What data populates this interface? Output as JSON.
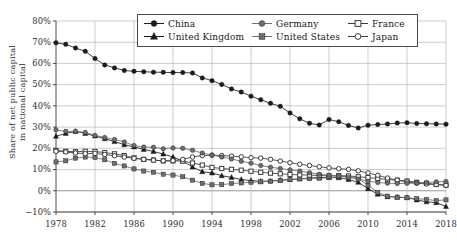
{
  "axis": {
    "ylabel_line1": "Share of net public capital",
    "ylabel_line2": "in national capital",
    "yticks": [
      "80%",
      "70%",
      "60%",
      "50%",
      "40%",
      "30%",
      "20%",
      "10%",
      "0%",
      "−10%"
    ],
    "xticks": [
      "1978",
      "1982",
      "1986",
      "1990",
      "1994",
      "1998",
      "2002",
      "2006",
      "2010",
      "2014",
      "2018"
    ]
  },
  "legend": {
    "rows": [
      [
        {
          "label": "China",
          "marker": "filled-circle",
          "color": "#1c1c1c",
          "icon": "legend-marker-icon"
        },
        {
          "label": "Germany",
          "marker": "filled-circle",
          "color": "#6e6e6e",
          "icon": "legend-marker-icon"
        },
        {
          "label": "France",
          "marker": "open-square",
          "color": "#3a3a3a",
          "icon": "legend-marker-icon"
        }
      ],
      [
        {
          "label": "United Kingdom",
          "marker": "filled-triangle",
          "color": "#1c1c1c",
          "icon": "legend-marker-icon"
        },
        {
          "label": "United States",
          "marker": "filled-square",
          "color": "#6e6e6e",
          "icon": "legend-marker-icon"
        },
        {
          "label": "Japan",
          "marker": "open-circle",
          "color": "#3a3a3a",
          "icon": "legend-marker-icon"
        }
      ]
    ]
  },
  "chart_data": {
    "type": "line",
    "title": "",
    "xlabel": "",
    "ylabel": "Share of net public capital in national capital",
    "xlim": [
      1978,
      2018
    ],
    "ylim": [
      -10,
      80
    ],
    "ytick_values": [
      80,
      70,
      60,
      50,
      40,
      30,
      20,
      10,
      0,
      -10
    ],
    "xtick_values": [
      1978,
      1982,
      1986,
      1990,
      1994,
      1998,
      2002,
      2006,
      2010,
      2014,
      2018
    ],
    "grid": "horizontal-and-vertical",
    "legend_position": "top-center",
    "x": [
      1978,
      1979,
      1980,
      1981,
      1982,
      1983,
      1984,
      1985,
      1986,
      1987,
      1988,
      1989,
      1990,
      1991,
      1992,
      1993,
      1994,
      1995,
      1996,
      1997,
      1998,
      1999,
      2000,
      2001,
      2002,
      2003,
      2004,
      2005,
      2006,
      2007,
      2008,
      2009,
      2010,
      2011,
      2012,
      2013,
      2014,
      2015,
      2016,
      2017,
      2018
    ],
    "series": [
      {
        "name": "China",
        "marker": "filled-circle",
        "color": "#1c1c1c",
        "values": [
          69.7,
          69.0,
          67.3,
          65.7,
          62.3,
          59.3,
          57.9,
          56.7,
          56.3,
          56.1,
          55.9,
          55.8,
          55.7,
          55.7,
          55.5,
          53.2,
          51.9,
          50.1,
          48.0,
          46.5,
          44.6,
          42.9,
          41.2,
          39.8,
          36.7,
          33.9,
          31.8,
          31.0,
          33.6,
          32.5,
          30.8,
          29.6,
          30.9,
          31.2,
          31.5,
          31.9,
          32.1,
          31.7,
          31.6,
          31.5,
          31.4
        ]
      },
      {
        "name": "Germany",
        "marker": "filled-circle",
        "color": "#6e6e6e",
        "values": [
          28.7,
          28.0,
          28.0,
          27.5,
          26.1,
          25.1,
          24.2,
          23.0,
          21.3,
          20.6,
          20.5,
          19.8,
          20.2,
          20.0,
          19.1,
          17.8,
          16.8,
          15.9,
          15.0,
          13.9,
          13.0,
          11.9,
          11.1,
          10.5,
          9.9,
          9.3,
          8.5,
          7.8,
          7.3,
          6.9,
          6.3,
          5.5,
          4.5,
          3.9,
          3.6,
          3.4,
          3.5,
          3.6,
          3.9,
          4.2,
          4.4
        ]
      },
      {
        "name": "France",
        "marker": "open-square",
        "color": "#3a3a3a",
        "values": [
          19.0,
          18.6,
          18.4,
          18.6,
          18.5,
          18.0,
          17.4,
          16.6,
          15.5,
          14.8,
          14.5,
          14.1,
          14.1,
          14.0,
          13.1,
          12.1,
          11.0,
          10.5,
          10.1,
          9.7,
          9.2,
          8.7,
          8.3,
          8.0,
          7.7,
          7.5,
          7.4,
          7.2,
          7.0,
          7.1,
          7.0,
          6.6,
          6.2,
          5.8,
          5.3,
          5.0,
          4.6,
          4.0,
          3.5,
          3.0,
          2.7
        ]
      },
      {
        "name": "United Kingdom",
        "marker": "filled-triangle",
        "color": "#1c1c1c",
        "values": [
          25.7,
          27.0,
          28.0,
          27.0,
          25.8,
          24.5,
          23.2,
          21.7,
          20.7,
          19.5,
          18.5,
          17.3,
          15.9,
          14.0,
          11.2,
          9.0,
          8.4,
          7.1,
          6.3,
          5.3,
          4.8,
          4.5,
          4.6,
          5.0,
          5.3,
          5.6,
          6.0,
          6.2,
          6.3,
          6.1,
          5.3,
          4.0,
          1.0,
          -1.6,
          -2.8,
          -3.0,
          -3.2,
          -4.3,
          -5.2,
          -5.6,
          -7.4
        ]
      },
      {
        "name": "United States",
        "marker": "filled-square",
        "color": "#6e6e6e",
        "values": [
          13.6,
          14.1,
          15.4,
          15.9,
          15.7,
          14.6,
          12.9,
          11.7,
          10.3,
          9.3,
          8.7,
          7.8,
          7.4,
          6.6,
          5.0,
          3.5,
          2.8,
          2.9,
          3.4,
          3.7,
          4.0,
          4.2,
          4.5,
          4.9,
          5.3,
          5.6,
          5.8,
          5.9,
          6.2,
          6.6,
          6.7,
          5.7,
          2.6,
          -0.8,
          -2.5,
          -3.0,
          -3.3,
          -3.7,
          -4.1,
          -4.6,
          -4.3
        ]
      },
      {
        "name": "Japan",
        "marker": "open-circle",
        "color": "#3a3a3a",
        "values": [
          18.6,
          18.3,
          17.8,
          17.5,
          17.6,
          17.1,
          16.5,
          15.9,
          15.3,
          14.8,
          14.4,
          14.1,
          14.2,
          14.8,
          15.9,
          16.6,
          16.8,
          16.6,
          16.3,
          16.0,
          15.6,
          15.4,
          14.8,
          14.0,
          13.2,
          12.5,
          11.9,
          11.3,
          10.8,
          10.4,
          10.1,
          9.4,
          8.4,
          7.3,
          6.0,
          5.0,
          4.2,
          3.6,
          3.2,
          2.9,
          2.6
        ]
      }
    ]
  }
}
